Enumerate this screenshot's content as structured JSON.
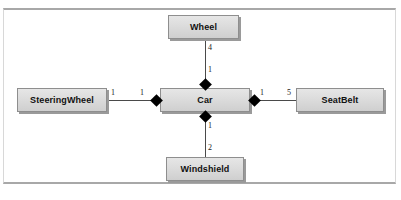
{
  "diagram": {
    "type": "uml-composition-diagram",
    "center": {
      "id": "car",
      "label": "Car"
    },
    "nodes": [
      {
        "id": "wheel",
        "label": "Wheel"
      },
      {
        "id": "steeringwheel",
        "label": "SteeringWheel"
      },
      {
        "id": "car",
        "label": "Car"
      },
      {
        "id": "seatbelt",
        "label": "SeatBelt"
      },
      {
        "id": "windshield",
        "label": "Windshield"
      }
    ],
    "relations": [
      {
        "id": "car-wheel",
        "whole": "Car",
        "part": "Wheel",
        "kind": "composition",
        "whole_multiplicity": "1",
        "part_multiplicity": "4"
      },
      {
        "id": "car-steeringwheel",
        "whole": "Car",
        "part": "SteeringWheel",
        "kind": "composition",
        "whole_multiplicity": "1",
        "part_multiplicity": "1"
      },
      {
        "id": "car-seatbelt",
        "whole": "Car",
        "part": "SeatBelt",
        "kind": "composition",
        "whole_multiplicity": "1",
        "part_multiplicity": "5"
      },
      {
        "id": "car-windshield",
        "whole": "Car",
        "part": "Windshield",
        "kind": "composition",
        "whole_multiplicity": "1",
        "part_multiplicity": "2"
      }
    ],
    "multiplicities": {
      "wheel_near_car": "1",
      "wheel_near_wheel": "4",
      "steeringwheel_near_car": "1",
      "steeringwheel_near_steeringwheel": "1",
      "seatbelt_near_car": "1",
      "seatbelt_near_seatbelt": "5",
      "windshield_near_car": "1",
      "windshield_near_windshield": "2"
    },
    "colors": {
      "node_fill": "#dcdcdc",
      "node_border": "#8e8e8e",
      "node_shadow": "#9a9a9a",
      "line": "#4a4a4a",
      "diamond": "#000000",
      "frame_rule": "#a8a8a8",
      "text": "#111111",
      "background": "#ffffff"
    }
  }
}
